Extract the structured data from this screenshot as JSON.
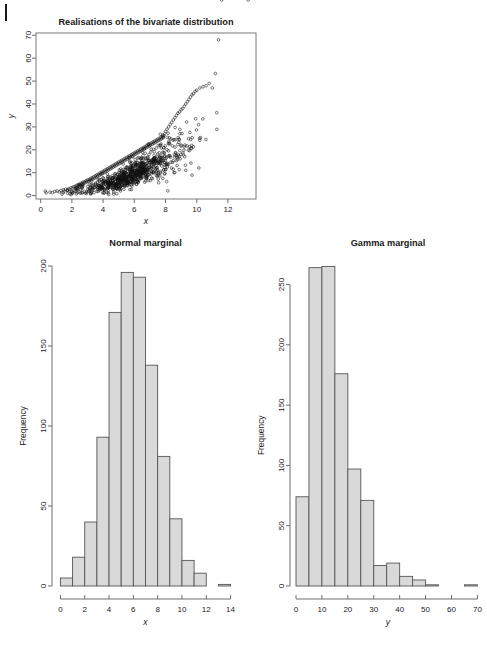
{
  "figure": {
    "background_color": "#ffffff",
    "bar_fill_color": "#d9d9d9",
    "bar_border_color": "#555555",
    "axis_color": "#6e6e6e",
    "point_color": "#111111"
  },
  "panels": {
    "scatter": {
      "title": "Realisations of the bivariate distribution",
      "xlabel": "x",
      "ylabel": "y"
    },
    "normal": {
      "title": "Normal marginal",
      "xlabel": "x",
      "ylabel": "Frequency"
    },
    "gamma": {
      "title": "Gamma marginal",
      "xlabel": "y",
      "ylabel": "Frequency"
    }
  },
  "chart_data": [
    {
      "type": "scatter",
      "title": "Realisations of the bivariate distribution",
      "xlabel": "x",
      "ylabel": "y",
      "xlim": [
        -0.3,
        13.8
      ],
      "ylim": [
        -1.5,
        71
      ],
      "xticks": [
        0,
        2,
        4,
        6,
        8,
        10,
        12
      ],
      "yticks": [
        0,
        10,
        20,
        30,
        40,
        50,
        60,
        70
      ],
      "grid": false,
      "legend": "none",
      "n_points": 1000,
      "description": "Positively correlated, curved (exponential-like) relationship between a normal variate x and a gamma variate y; spread widens with x.",
      "notable_points": [
        [
          13.3,
          68
        ],
        [
          11.6,
          53.3
        ],
        [
          8.1,
          11.6
        ],
        [
          11.5,
          48
        ],
        [
          11.4,
          47
        ]
      ],
      "x": [
        0.35,
        0.6,
        0.75,
        0.9,
        1.05,
        1.2,
        1.3,
        1.45,
        1.5,
        1.6,
        1.7,
        1.8,
        1.85,
        1.95,
        2.0,
        2.05,
        2.1,
        2.2,
        2.25,
        2.3,
        2.35,
        2.4,
        2.45,
        2.5,
        2.55,
        2.6,
        2.65,
        2.7,
        2.75,
        2.8,
        2.85,
        2.9,
        2.95,
        3.0,
        3.05,
        3.1,
        3.15,
        3.2,
        3.25,
        3.3,
        3.35,
        3.4,
        3.45,
        3.5,
        3.55,
        3.6,
        3.65,
        3.7,
        3.75,
        3.8,
        3.85,
        3.9,
        3.95,
        4.0,
        4.05,
        4.1,
        4.15,
        4.2,
        4.25,
        4.3,
        4.35,
        4.4,
        4.45,
        4.5,
        4.55,
        4.6,
        4.65,
        4.7,
        4.75,
        4.8,
        4.85,
        4.9,
        4.95,
        5.0,
        5.05,
        5.1,
        5.15,
        5.2,
        5.25,
        5.3,
        5.35,
        5.4,
        5.45,
        5.5,
        5.55,
        5.6,
        5.65,
        5.7,
        5.75,
        5.8,
        5.85,
        5.9,
        5.95,
        6.0,
        6.05,
        6.1,
        6.15,
        6.2,
        6.25,
        6.3,
        6.35,
        6.4,
        6.45,
        6.5,
        6.55,
        6.6,
        6.65,
        6.7,
        6.75,
        6.8,
        6.85,
        6.9,
        6.95,
        7.0,
        7.05,
        7.1,
        7.15,
        7.2,
        7.25,
        7.3,
        7.35,
        7.4,
        7.45,
        7.5,
        7.55,
        7.6,
        7.65,
        7.7,
        7.75,
        7.8,
        7.85,
        7.9,
        7.95,
        8.0,
        8.1,
        8.2,
        8.3,
        8.4,
        8.5,
        8.6,
        8.7,
        8.8,
        8.9,
        9.0,
        9.1,
        9.2,
        9.3,
        9.4,
        9.5,
        9.6,
        9.7,
        9.8,
        9.9,
        10.0,
        10.2,
        10.4,
        10.6,
        10.8,
        11.0,
        11.2,
        11.4,
        11.6,
        13.3
      ],
      "y": [
        1.2,
        1.5,
        1.3,
        1.8,
        2.0,
        1.6,
        2.2,
        2.5,
        1.9,
        2.8,
        2.4,
        3.0,
        2.6,
        3.4,
        1.8,
        3.2,
        3.8,
        4.0,
        3.5,
        4.4,
        3.0,
        4.8,
        4.2,
        5.0,
        4.6,
        5.4,
        5.0,
        5.8,
        5.2,
        6.0,
        5.6,
        6.4,
        6.0,
        6.8,
        6.2,
        7.0,
        6.6,
        7.4,
        6.9,
        7.8,
        7.2,
        8.2,
        7.6,
        8.6,
        8.0,
        9.0,
        8.4,
        9.4,
        8.8,
        9.8,
        9.2,
        10.2,
        9.6,
        10.6,
        10.0,
        11.0,
        10.4,
        11.4,
        10.8,
        11.8,
        11.2,
        12.2,
        11.6,
        12.6,
        12.0,
        13.0,
        12.4,
        13.4,
        12.8,
        13.8,
        13.2,
        14.2,
        13.6,
        14.6,
        14.0,
        15.0,
        14.4,
        15.4,
        14.8,
        15.8,
        15.2,
        16.2,
        15.6,
        16.6,
        16.0,
        17.0,
        16.4,
        17.4,
        16.8,
        17.8,
        17.2,
        18.2,
        17.6,
        18.6,
        18.0,
        19.0,
        18.4,
        19.4,
        18.8,
        19.8,
        19.2,
        20.2,
        19.6,
        20.6,
        20.0,
        21.0,
        20.4,
        21.4,
        20.8,
        21.8,
        21.2,
        22.2,
        21.6,
        22.6,
        22.0,
        23.0,
        22.4,
        23.4,
        22.8,
        23.8,
        23.2,
        24.2,
        23.6,
        24.6,
        24.0,
        25.0,
        24.4,
        25.4,
        24.8,
        25.8,
        25.2,
        26.2,
        27.0,
        28.0,
        29.0,
        30.0,
        31.0,
        32.0,
        33.0,
        34.0,
        35.0,
        36.0,
        36.5,
        37.5,
        38.0,
        39.0,
        40.0,
        41.0,
        42.0,
        43.0,
        44.0,
        44.5,
        45.5,
        46.0,
        47.0,
        47.5,
        48.0,
        49.0,
        47.0,
        53.3,
        68.0
      ]
    },
    {
      "type": "bar",
      "subtype": "histogram",
      "title": "Normal marginal",
      "xlabel": "x",
      "ylabel": "Frequency",
      "xlim": [
        -0.2,
        14.2
      ],
      "ylim": [
        0,
        205
      ],
      "xticks": [
        0,
        2,
        4,
        6,
        8,
        10,
        12,
        14
      ],
      "yticks": [
        0,
        50,
        100,
        150,
        200
      ],
      "grid": false,
      "legend": "none",
      "bin_width": 1,
      "bin_edges": [
        0,
        1,
        2,
        3,
        4,
        5,
        6,
        7,
        8,
        9,
        10,
        11,
        12,
        13,
        14
      ],
      "categories": [
        "0-1",
        "1-2",
        "2-3",
        "3-4",
        "4-5",
        "5-6",
        "6-7",
        "7-8",
        "8-9",
        "9-10",
        "10-11",
        "11-12",
        "12-13",
        "13-14"
      ],
      "values": [
        5,
        18,
        40,
        93,
        171,
        196,
        193,
        138,
        81,
        42,
        16,
        8,
        0,
        1
      ]
    },
    {
      "type": "bar",
      "subtype": "histogram",
      "title": "Gamma marginal",
      "xlabel": "y",
      "ylabel": "Frequency",
      "xlim": [
        0,
        71
      ],
      "ylim": [
        0,
        272
      ],
      "xticks": [
        0,
        10,
        20,
        30,
        40,
        50,
        60,
        70
      ],
      "yticks": [
        0,
        50,
        100,
        150,
        200,
        250
      ],
      "grid": false,
      "legend": "none",
      "bin_width": 5,
      "bin_edges": [
        0,
        5,
        10,
        15,
        20,
        25,
        30,
        35,
        40,
        45,
        50,
        55,
        60,
        65,
        70
      ],
      "categories": [
        "0-5",
        "5-10",
        "10-15",
        "15-20",
        "20-25",
        "25-30",
        "30-35",
        "35-40",
        "40-45",
        "45-50",
        "50-55",
        "55-60",
        "60-65",
        "65-70"
      ],
      "values": [
        74,
        264,
        265,
        176,
        97,
        71,
        17,
        19,
        8,
        5,
        1,
        0,
        0,
        1
      ]
    }
  ]
}
